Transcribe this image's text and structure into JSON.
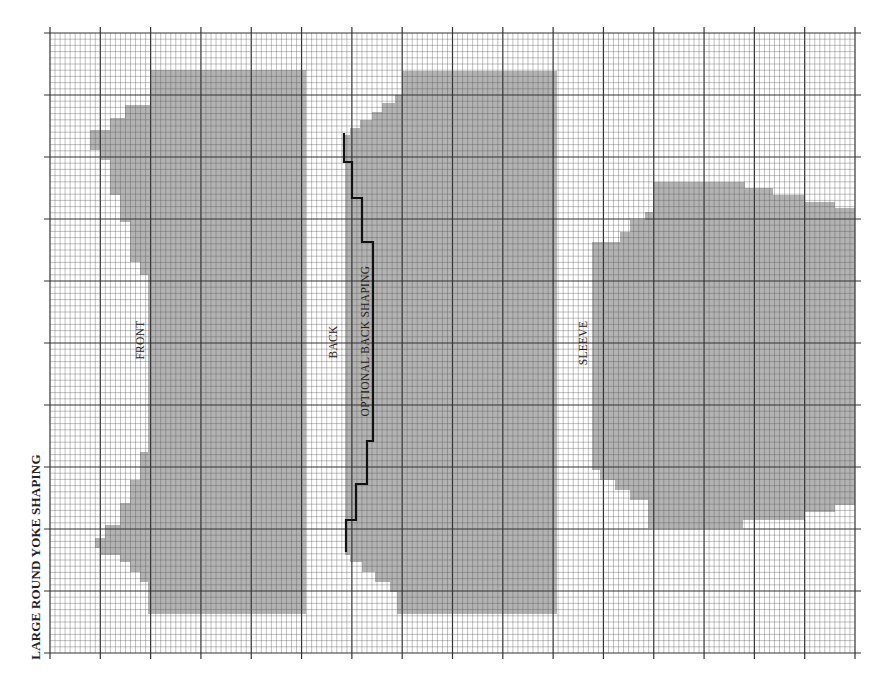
{
  "title": "LARGE ROUND YOKE SHAPING",
  "grid": {
    "left": 50,
    "top": 33,
    "right": 855,
    "bottom": 653,
    "major_cols": 16,
    "major_rows": 10,
    "minor_per_major": 10,
    "line_color": "#333333",
    "minor_color": "#555555"
  },
  "colors": {
    "fill": "#b3b3b3",
    "shaping_line": "#111111",
    "background": "#ffffff"
  },
  "pieces": [
    {
      "name": "FRONT",
      "label_x": 140,
      "label_y": 340,
      "polygon": [
        [
          150,
          70
        ],
        [
          306,
          70
        ],
        [
          306,
          614
        ],
        [
          148,
          614
        ],
        [
          148,
          582
        ],
        [
          140,
          582
        ],
        [
          140,
          572
        ],
        [
          130,
          572
        ],
        [
          130,
          562
        ],
        [
          120,
          562
        ],
        [
          120,
          555
        ],
        [
          100,
          555
        ],
        [
          100,
          548
        ],
        [
          95,
          548
        ],
        [
          95,
          538
        ],
        [
          105,
          538
        ],
        [
          105,
          525
        ],
        [
          120,
          525
        ],
        [
          120,
          503
        ],
        [
          130,
          503
        ],
        [
          130,
          480
        ],
        [
          140,
          480
        ],
        [
          140,
          452
        ],
        [
          148,
          452
        ],
        [
          148,
          275
        ],
        [
          140,
          275
        ],
        [
          140,
          262
        ],
        [
          130,
          262
        ],
        [
          130,
          222
        ],
        [
          120,
          222
        ],
        [
          120,
          195
        ],
        [
          110,
          195
        ],
        [
          110,
          160
        ],
        [
          100,
          160
        ],
        [
          100,
          150
        ],
        [
          90,
          150
        ],
        [
          90,
          130
        ],
        [
          110,
          130
        ],
        [
          110,
          118
        ],
        [
          125,
          118
        ],
        [
          125,
          105
        ],
        [
          150,
          105
        ]
      ]
    },
    {
      "name": "BACK",
      "label_x": 333,
      "label_y": 342,
      "polygon": [
        [
          402,
          71
        ],
        [
          557,
          71
        ],
        [
          557,
          614
        ],
        [
          397,
          614
        ],
        [
          397,
          592
        ],
        [
          390,
          592
        ],
        [
          390,
          582
        ],
        [
          375,
          582
        ],
        [
          375,
          572
        ],
        [
          362,
          572
        ],
        [
          362,
          562
        ],
        [
          350,
          562
        ],
        [
          350,
          555
        ],
        [
          345,
          555
        ],
        [
          345,
          135
        ],
        [
          350,
          135
        ],
        [
          350,
          128
        ],
        [
          360,
          128
        ],
        [
          360,
          120
        ],
        [
          372,
          120
        ],
        [
          372,
          112
        ],
        [
          382,
          112
        ],
        [
          382,
          103
        ],
        [
          395,
          103
        ],
        [
          395,
          95
        ],
        [
          402,
          95
        ]
      ]
    },
    {
      "name": "SLEEVE",
      "label_x": 583,
      "label_y": 343,
      "polygon": [
        [
          653,
          182
        ],
        [
          745,
          182
        ],
        [
          745,
          188
        ],
        [
          773,
          188
        ],
        [
          773,
          195
        ],
        [
          805,
          195
        ],
        [
          805,
          202
        ],
        [
          835,
          202
        ],
        [
          835,
          208
        ],
        [
          855,
          208
        ],
        [
          855,
          505
        ],
        [
          835,
          505
        ],
        [
          835,
          512
        ],
        [
          805,
          512
        ],
        [
          805,
          520
        ],
        [
          743,
          520
        ],
        [
          743,
          528
        ],
        [
          648,
          528
        ],
        [
          648,
          500
        ],
        [
          630,
          500
        ],
        [
          630,
          490
        ],
        [
          615,
          490
        ],
        [
          615,
          480
        ],
        [
          600,
          480
        ],
        [
          600,
          470
        ],
        [
          592,
          470
        ],
        [
          592,
          242
        ],
        [
          620,
          242
        ],
        [
          620,
          232
        ],
        [
          630,
          232
        ],
        [
          630,
          220
        ],
        [
          645,
          220
        ],
        [
          645,
          212
        ],
        [
          653,
          212
        ]
      ]
    }
  ],
  "optional_back_shaping": {
    "label": "OPTIONAL BACK SHAPING",
    "label_x": 365,
    "label_y": 341,
    "path": [
      [
        344,
        133
      ],
      [
        344,
        162
      ],
      [
        352,
        162
      ],
      [
        352,
        198
      ],
      [
        362,
        198
      ],
      [
        362,
        242
      ],
      [
        373,
        242
      ],
      [
        373,
        441
      ],
      [
        367,
        441
      ],
      [
        367,
        484
      ],
      [
        356,
        484
      ],
      [
        356,
        520
      ],
      [
        346,
        520
      ],
      [
        346,
        552
      ]
    ]
  },
  "labels": {
    "front": "FRONT",
    "back": "BACK",
    "sleeve": "SLEEVE",
    "optional": "OPTIONAL BACK SHAPING"
  }
}
